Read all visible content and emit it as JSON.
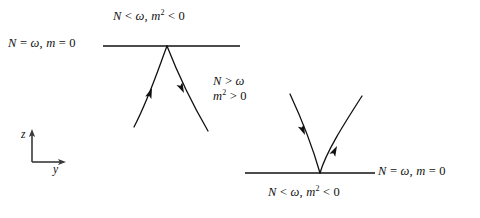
{
  "figure": {
    "type": "physics-spacetime-diagram",
    "background_color": "#ffffff",
    "stroke_color": "#111111",
    "labels": {
      "top_region": {
        "text": "N < ω,  m² < 0",
        "parts": [
          "N",
          "<",
          "ω",
          ",",
          "m",
          "2",
          "<",
          "0"
        ]
      },
      "left_line": {
        "text": "N = ω,  m = 0",
        "parts": [
          "N",
          "=",
          "ω",
          ",",
          "m",
          "=",
          "0"
        ]
      },
      "middle_region_line1": {
        "text": "N > ω",
        "parts": [
          "N",
          ">",
          "ω"
        ]
      },
      "middle_region_line2": {
        "text": "m² > 0",
        "parts": [
          "m",
          "2",
          ">",
          "0"
        ]
      },
      "right_line": {
        "text": "N = ω,  m = 0",
        "parts": [
          "N",
          "=",
          "ω",
          ",",
          "m",
          "=",
          "0"
        ]
      },
      "bottom_region": {
        "text": "N < ω,  m² < 0",
        "parts": [
          "N",
          "<",
          "ω",
          ",",
          "m",
          "2",
          "<",
          "0"
        ]
      }
    },
    "axes": {
      "vertical_label": "z",
      "horizontal_label": "y",
      "origin": [
        32,
        162
      ],
      "vertical_tip": [
        32,
        131
      ],
      "horizontal_tip": [
        66,
        162
      ]
    },
    "horizontal_lines": [
      {
        "name": "upper-boundary",
        "x1": 103,
        "x2": 240,
        "y": 46
      },
      {
        "name": "lower-boundary",
        "x1": 245,
        "x2": 375,
        "y": 173
      }
    ],
    "cones": [
      {
        "name": "upper-cone",
        "apex": [
          167,
          46
        ],
        "opens": "down",
        "left_branch_end": [
          134,
          127
        ],
        "right_branch_end": [
          208,
          131
        ],
        "left_arrow_direction": "toward-apex",
        "right_arrow_direction": "away-from-apex"
      },
      {
        "name": "lower-cone",
        "apex": [
          320,
          173
        ],
        "opens": "up",
        "left_branch_end": [
          290,
          94
        ],
        "right_branch_end": [
          362,
          96
        ],
        "left_arrow_direction": "toward-apex",
        "right_arrow_direction": "away-from-apex"
      }
    ]
  }
}
